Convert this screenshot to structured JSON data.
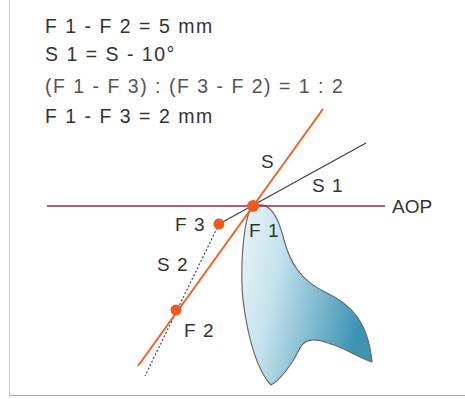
{
  "formulas": [
    "F 1 - F 2 = 5 mm",
    "S 1 = S - 10°",
    "(F 1 - F 3) : (F 3 - F 2) = 1 : 2",
    "F 1 - F 3 = 2 mm"
  ],
  "labels": {
    "s": "S",
    "s1": "S 1",
    "s2": "S 2",
    "aop": "AOP",
    "f1": "F 1",
    "f2": "F 2",
    "f3": "F 3"
  },
  "colors": {
    "orange_line": "#f0641e",
    "point": "#f05a1e",
    "s1_line": "#3c3c64",
    "aop_line": "#8c2850",
    "dotted_line": "#3c4678",
    "tooth_fill_light": "#e6f4f8",
    "tooth_fill_dark": "#4ea0be",
    "tooth_outline": "#646464"
  }
}
